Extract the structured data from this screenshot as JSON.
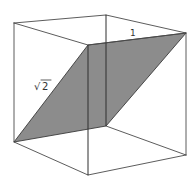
{
  "figure": {
    "type": "cube-cross-section",
    "colors": {
      "background": "#ffffff",
      "edge": "#4a4a4a",
      "section_fill": "#8c8c8c"
    },
    "labels": {
      "top_edge": "1",
      "diagonal_edge_root": "√",
      "diagonal_edge_radicand": "2"
    }
  }
}
